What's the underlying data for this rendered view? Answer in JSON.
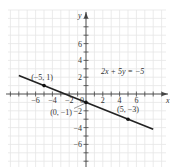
{
  "chart_data": {
    "type": "line",
    "title": "",
    "xlabel": "x",
    "ylabel": "y",
    "xlim": [
      -9,
      9.5
    ],
    "ylim": [
      -8,
      10
    ],
    "grid": true,
    "x_ticks": [
      -6,
      -4,
      -2,
      2,
      4,
      6
    ],
    "y_ticks": [
      6,
      4,
      2,
      -2,
      -4,
      -6
    ],
    "equation_label": "2x + 5y = −5",
    "line": {
      "x": [
        -8,
        8
      ],
      "y": [
        2.2,
        -4.2
      ]
    },
    "points": [
      {
        "x": -5,
        "y": 1,
        "label": "(−5, 1)"
      },
      {
        "x": 0,
        "y": -1,
        "label": "(0, −1)"
      },
      {
        "x": 5,
        "y": -3,
        "label": "(5, −3)"
      }
    ],
    "origin_label": "0",
    "colors": {
      "grid": "#e6e6e6",
      "axis": "#444444",
      "line": "#222222"
    }
  }
}
